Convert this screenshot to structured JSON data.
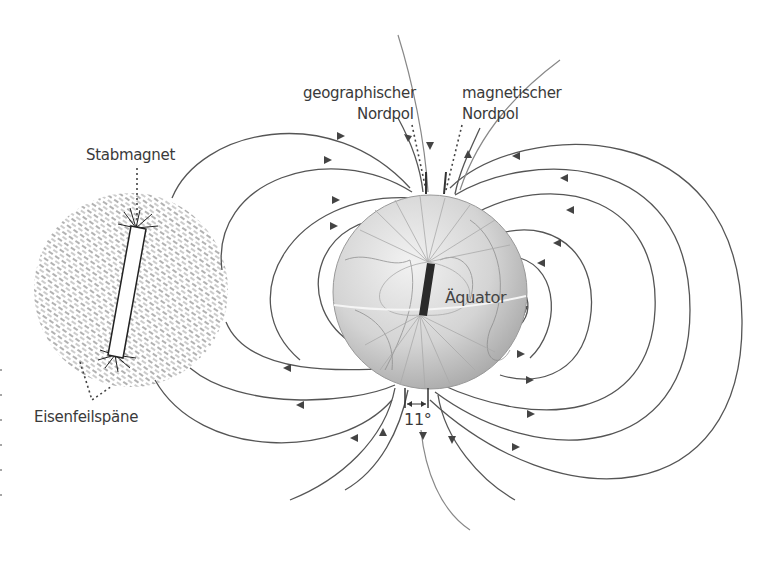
{
  "diagram": {
    "labels": {
      "bar_magnet": "Stabmagnet",
      "iron_filings": "Eisenfeilspäne",
      "geographic_north_line1": "geographischer",
      "geographic_north_line2": "Nordpol",
      "magnetic_north_line1": "magnetischer",
      "magnetic_north_line2": "Nordpol",
      "equator": "Äquator",
      "declination_angle": "11°"
    },
    "elements": [
      {
        "id": "iron-filings-disc",
        "kind": "circle",
        "desc": "Iron filings pattern around bar magnet"
      },
      {
        "id": "bar-magnet",
        "kind": "rectangle",
        "desc": "Tilted bar magnet"
      },
      {
        "id": "earth-globe",
        "kind": "circle",
        "desc": "Earth globe with internal dipole"
      },
      {
        "id": "earth-dipole",
        "kind": "rectangle",
        "desc": "Dark bar magnet inside Earth, tilted"
      },
      {
        "id": "field-lines",
        "kind": "curves",
        "desc": "Magnetic field lines with direction arrows"
      }
    ],
    "colors": {
      "line": "#555555",
      "text": "#3a3a3a",
      "globe": "#d6d6d6",
      "dipole": "#2a2a2a",
      "background": "#ffffff"
    }
  }
}
